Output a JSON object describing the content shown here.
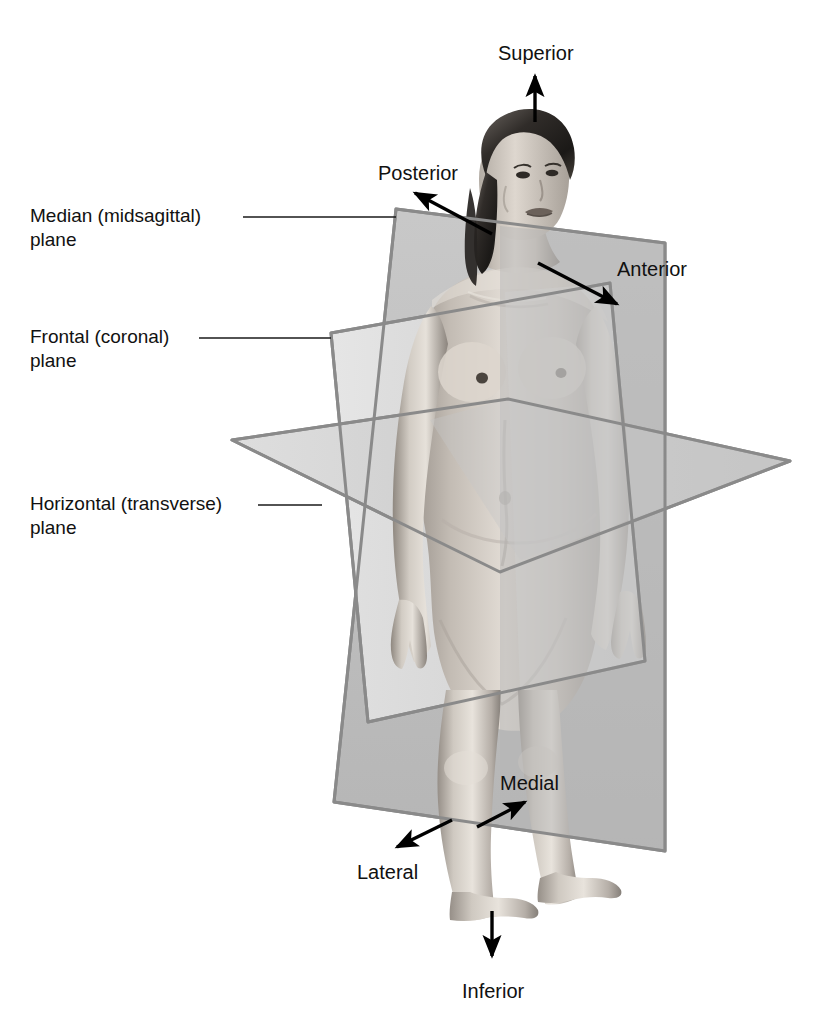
{
  "colors": {
    "plane_edge": "#8a8a8a",
    "sagittal_fill": "#b9b9b9",
    "frontal_fill": "#d8d8d8",
    "horizontal_fill": "#c9c9c9",
    "leader_line": "#1a1a1a",
    "arrow": "#000000",
    "text": "#111111",
    "background": "#ffffff"
  },
  "plane_labels": [
    {
      "id": "median-plane",
      "line1": "Median (midsagittal)",
      "line2": "plane",
      "text": "Median (midsagittal)\nplane",
      "x": 30,
      "y": 205,
      "leader": {
        "x1": 243,
        "y1": 217,
        "x2": 396,
        "y2": 217
      }
    },
    {
      "id": "frontal-plane",
      "line1": "Frontal (coronal)",
      "line2": "plane",
      "text": "Frontal (coronal)\nplane",
      "x": 30,
      "y": 325,
      "leader": {
        "x1": 199,
        "y1": 338,
        "x2": 331,
        "y2": 338
      }
    },
    {
      "id": "horizontal-plane",
      "line1": "Horizontal (transverse)",
      "line2": "plane",
      "text": "Horizontal (transverse)\nplane",
      "x": 30,
      "y": 492,
      "leader": {
        "x1": 258,
        "y1": 505,
        "x2": 322,
        "y2": 505
      }
    }
  ],
  "direction_labels": [
    {
      "id": "superior",
      "text": "Superior",
      "x": 498,
      "y": 43,
      "anchor": "start"
    },
    {
      "id": "posterior",
      "text": "Posterior",
      "x": 378,
      "y": 162,
      "anchor": "start"
    },
    {
      "id": "anterior",
      "text": "Anterior",
      "x": 617,
      "y": 258,
      "anchor": "start"
    },
    {
      "id": "medial",
      "text": "Medial",
      "x": 500,
      "y": 773,
      "anchor": "start"
    },
    {
      "id": "lateral",
      "text": "Lateral",
      "x": 357,
      "y": 862,
      "anchor": "start"
    },
    {
      "id": "inferior",
      "text": "Inferior",
      "x": 462,
      "y": 980,
      "anchor": "start"
    }
  ],
  "direction_arrows": [
    {
      "id": "superior-arrow",
      "from": [
        535,
        122
      ],
      "to": [
        535,
        74
      ]
    },
    {
      "id": "posterior-arrow",
      "from": [
        492,
        234
      ],
      "to": [
        413,
        192
      ]
    },
    {
      "id": "anterior-arrow",
      "from": [
        538,
        263
      ],
      "to": [
        619,
        306
      ]
    },
    {
      "id": "medial-arrow",
      "from": [
        477,
        827
      ],
      "to": [
        527,
        801
      ]
    },
    {
      "id": "lateral-arrow",
      "from": [
        452,
        820
      ],
      "to": [
        395,
        848
      ]
    },
    {
      "id": "inferior-arrow",
      "from": [
        492,
        911
      ],
      "to": [
        492,
        958
      ]
    }
  ]
}
